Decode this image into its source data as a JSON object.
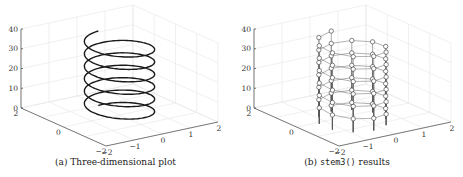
{
  "chart_data": [
    {
      "type": "line3d",
      "title": "",
      "caption_label": "(a)",
      "caption_text": "Three-dimensional plot",
      "xlabel": "",
      "ylabel": "",
      "zlabel": "",
      "xlim": [
        -2,
        2
      ],
      "ylim": [
        -2,
        2
      ],
      "zlim": [
        0,
        40
      ],
      "x_ticks": [
        "-2",
        "-1",
        "0",
        "1",
        "2"
      ],
      "y_ticks": [
        "-2",
        "0",
        "2"
      ],
      "z_ticks": [
        "0",
        "10",
        "20",
        "30",
        "40"
      ],
      "grid": true,
      "series": [
        {
          "name": "helix",
          "x": "sin(t)",
          "y": "cos(t)",
          "z": "t",
          "t_range": [
            0,
            37.7
          ],
          "turns": 4
        }
      ]
    },
    {
      "type": "stem3",
      "title": "",
      "caption_label": "(b)",
      "caption_code": "stem3()",
      "caption_text": "results",
      "xlabel": "",
      "ylabel": "",
      "zlabel": "",
      "xlim": [
        -2,
        2
      ],
      "ylim": [
        -2,
        2
      ],
      "zlim": [
        0,
        40
      ],
      "x_ticks": [
        "-2",
        "-1",
        "0",
        "1",
        "2"
      ],
      "y_ticks": [
        "-2",
        "0",
        "2"
      ],
      "z_ticks": [
        "0",
        "10",
        "20",
        "30",
        "40"
      ],
      "grid": true,
      "series": [
        {
          "name": "helix stems",
          "x": "sin(t)",
          "y": "cos(t)",
          "z": "t",
          "t_range": [
            0,
            37.7
          ],
          "marker": "circle",
          "points": 60
        }
      ]
    }
  ],
  "panels": {
    "a": {
      "label": "(a)",
      "caption": "Three-dimensional plot"
    },
    "b": {
      "label": "(b)",
      "code": "stem3()",
      "caption": "results"
    }
  }
}
